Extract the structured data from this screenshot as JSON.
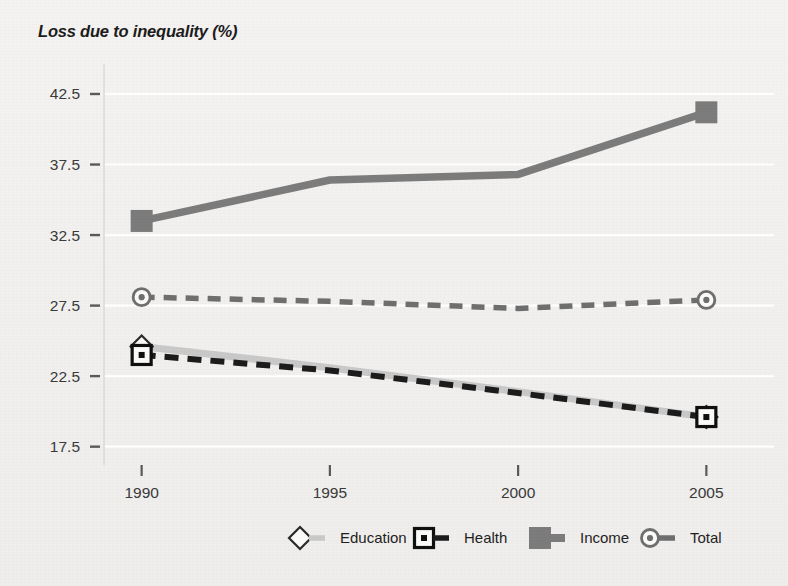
{
  "chart_data": {
    "type": "line",
    "title": "Loss due to inequality  (%)",
    "xlabel": "",
    "ylabel": "Loss due to inequality (%)",
    "x": [
      1990,
      1995,
      2000,
      2005
    ],
    "xtick_labels": [
      "1990",
      "1995",
      "2000",
      "2005"
    ],
    "ytick_labels": [
      "42.5",
      "37.5",
      "32.5",
      "27.5",
      "22.5",
      "17.5"
    ],
    "ytick_values": [
      42.5,
      37.5,
      32.5,
      27.5,
      22.5,
      17.5
    ],
    "ylim": [
      16.2,
      44.2
    ],
    "xlim": [
      1989.0,
      2006.0
    ],
    "grid": true,
    "legend_position": "bottom",
    "series": [
      {
        "name": "Education",
        "values": [
          24.6,
          23.1,
          21.4,
          19.6
        ],
        "color": "#c9c9c9",
        "marker": "diamond-open",
        "dash": "solid"
      },
      {
        "name": "Health",
        "values": [
          24.0,
          22.9,
          21.3,
          19.6
        ],
        "color": "#1c1c1c",
        "marker": "square-dot",
        "dash": "dashed"
      },
      {
        "name": "Income",
        "values": [
          33.5,
          36.4,
          36.8,
          41.2
        ],
        "color": "#7c7c7c",
        "marker": "square-filled",
        "dash": "solid"
      },
      {
        "name": "Total",
        "values": [
          28.1,
          27.8,
          27.3,
          27.9
        ],
        "color": "#6f6f6f",
        "marker": "circle-dot",
        "dash": "dashed"
      }
    ]
  },
  "legend": {
    "items": [
      {
        "label": "Education",
        "marker": "diamond-open-icon"
      },
      {
        "label": "Health",
        "marker": "square-dot-icon"
      },
      {
        "label": "Income",
        "marker": "square-filled-icon"
      },
      {
        "label": "Total",
        "marker": "circle-dot-icon"
      }
    ]
  },
  "colors": {
    "background": "#f2f1ef",
    "gridline": "#ffffff",
    "axis": "#8d8d8d",
    "text": "#1c1c1c",
    "education": "#c9c9c9",
    "health": "#1c1c1c",
    "income": "#7c7c7c",
    "total": "#6f6f6f"
  }
}
